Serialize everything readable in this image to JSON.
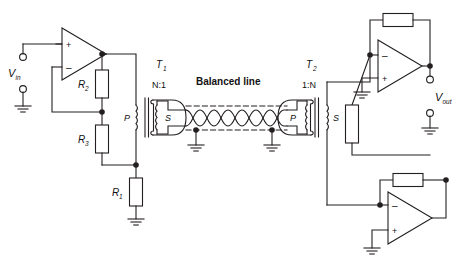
{
  "diagram": {
    "background": "#ffffff",
    "line_color": "#231f20",
    "resistor_fill": "#ffffff"
  },
  "labels": {
    "v_in": "V",
    "v_in_sub": "in",
    "v_out": "V",
    "v_out_sub": "out",
    "r1": "R",
    "r1_sub": "1",
    "r2": "R",
    "r2_sub": "2",
    "r3": "R",
    "r3_sub": "3",
    "t1": "T",
    "t1_sub": "1",
    "t2": "T",
    "t2_sub": "2",
    "t1_ratio": "N:1",
    "t2_ratio": "1:N",
    "balanced_line": "Balanced line",
    "p_left": "P",
    "s_left": "S",
    "p_right": "P",
    "s_right": "S",
    "opamp_plus": "+",
    "opamp_minus": "–"
  },
  "components": {
    "opamps": [
      {
        "name": "input-buffer-opamp",
        "plus_on_top": true
      },
      {
        "name": "output-opamp-top",
        "plus_on_top": false
      },
      {
        "name": "output-opamp-bottom",
        "plus_on_top": false
      }
    ],
    "resistors": [
      {
        "name": "r1",
        "orientation": "vertical"
      },
      {
        "name": "r2",
        "orientation": "vertical"
      },
      {
        "name": "r3",
        "orientation": "vertical"
      },
      {
        "name": "feedback-top",
        "orientation": "horizontal"
      },
      {
        "name": "bridge-vertical",
        "orientation": "vertical"
      },
      {
        "name": "feedback-bottom",
        "orientation": "horizontal"
      }
    ],
    "transformers": [
      {
        "name": "t1",
        "ratio": "N:1",
        "primary": "P",
        "secondary": "S",
        "shielded": "secondary"
      },
      {
        "name": "t2",
        "ratio": "1:N",
        "primary": "P",
        "secondary": "S",
        "shielded": "primary"
      }
    ],
    "grounds": 7,
    "terminals": 4,
    "twisted_pair_crossings": 7
  }
}
